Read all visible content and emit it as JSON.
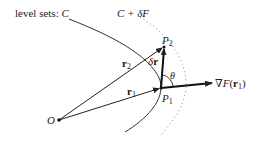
{
  "labels": {
    "level_sets_prefix": "level sets: ",
    "curve_c": "C",
    "curve_c_delta": "C + δF",
    "point_o": "O",
    "point_p1": "P",
    "point_p1_sub": "1",
    "point_p2": "P",
    "point_p2_sub": "2",
    "vector_r1": "r",
    "vector_r1_sub": "1",
    "vector_r2": "r",
    "vector_r2_sub": "2",
    "delta_r_delta": "δ",
    "delta_r_r": "r",
    "angle_theta": "θ",
    "gradient_nabla": "∇",
    "gradient_f": "F",
    "gradient_open": "(",
    "gradient_r": "r",
    "gradient_sub": "1",
    "gradient_close": ")"
  },
  "colors": {
    "line": "#222222",
    "dotted": "#888888",
    "background": "#ffffff"
  }
}
